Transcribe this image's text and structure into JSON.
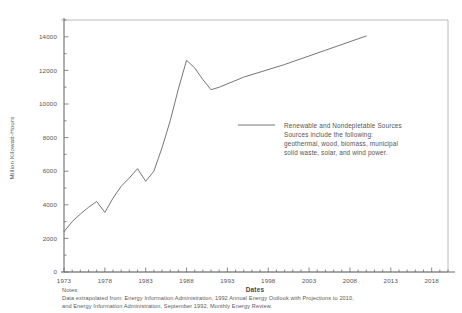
{
  "chart_data": {
    "type": "line",
    "title": "",
    "xlabel": "Dates",
    "ylabel": "Million Kilowatt-Hours",
    "xlim": [
      1973,
      2020
    ],
    "ylim": [
      0,
      15000
    ],
    "grid": false,
    "legend_position": "inside-right",
    "xticks": [
      "1973",
      "1978",
      "1983",
      "1988",
      "1993",
      "1998",
      "2003",
      "2008",
      "2013",
      "2018"
    ],
    "xtick_values": [
      1973,
      1978,
      1983,
      1988,
      1993,
      1998,
      2003,
      2008,
      2013,
      2018
    ],
    "yticks": [
      "0",
      "2000",
      "4000",
      "6000",
      "8000",
      "10000",
      "12000",
      "14000"
    ],
    "ytick_values": [
      0,
      2000,
      4000,
      6000,
      8000,
      10000,
      12000,
      14000
    ],
    "minor_tick_interval_y": 1000,
    "minor_tick_interval_x": 1,
    "series": [
      {
        "name": "Renewable and Nondepletable Sources",
        "color": "#666666",
        "x": [
          1973,
          1974,
          1975,
          1976,
          1977,
          1978,
          1979,
          1980,
          1981,
          1982,
          1983,
          1984,
          1985,
          1986,
          1987,
          1988,
          1989,
          1990,
          1991,
          1992,
          1995,
          2000,
          2005,
          2010
        ],
        "y": [
          2400,
          3000,
          3450,
          3850,
          4200,
          3550,
          4400,
          5100,
          5600,
          6150,
          5400,
          6000,
          7400,
          9000,
          10900,
          12600,
          12150,
          11450,
          10850,
          11000,
          11600,
          12350,
          13200,
          14050
        ]
      }
    ],
    "legend": {
      "line_color": "#666666",
      "lines": [
        "Renewable and Nondepletable Sources",
        "Sources include the following:",
        "geothermal, wood, biomass, municipal",
        "solid waste, solar, and wind power."
      ]
    },
    "notes": {
      "heading": "Notes:",
      "lines": [
        "Data extrapolated from:  Energy Information Administration, 1992 Annual Energy Outlook with Projections to 2010,",
        "and Energy Information Administration, September 1992, Monthly Energy Review."
      ]
    },
    "axis_color": "#777777",
    "frame_color": "#999999"
  }
}
